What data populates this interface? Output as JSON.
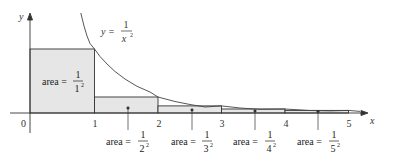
{
  "figure": {
    "function_label": {
      "lhs": "y =",
      "num": "1",
      "den": "x",
      "den_exp": "2"
    },
    "axes": {
      "x_label": "x",
      "y_label": "y",
      "origin_label": "0"
    },
    "x_ticks": [
      "1",
      "2",
      "3",
      "4",
      "5"
    ],
    "rectangles": [
      {
        "label": "area =",
        "num": "1",
        "den": "1",
        "exp": "2",
        "height": 1
      },
      {
        "label": "area =",
        "num": "1",
        "den": "2",
        "exp": "2",
        "height": 0.25
      },
      {
        "label": "area =",
        "num": "1",
        "den": "3",
        "exp": "2",
        "height": 0.1111
      },
      {
        "label": "area =",
        "num": "1",
        "den": "4",
        "exp": "2",
        "height": 0.0625
      },
      {
        "label": "area =",
        "num": "1",
        "den": "5",
        "exp": "2",
        "height": 0.04
      }
    ],
    "colors": {
      "fill": "#e6e6e6",
      "stroke": "#333333",
      "curve": "#444444"
    }
  }
}
